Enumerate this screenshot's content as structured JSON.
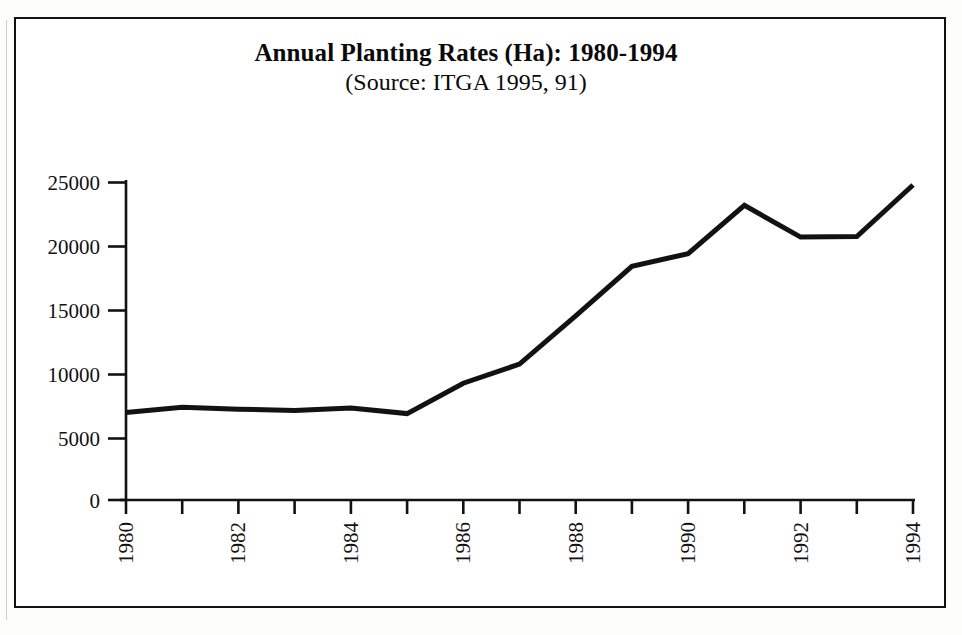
{
  "figure": {
    "title": "Annual Planting Rates (Ha): 1980-1994",
    "subtitle": "(Source: ITGA 1995, 91)"
  },
  "axes": {
    "y_tick_labels": [
      "25000",
      "20000",
      "15000",
      "10000",
      "5000",
      "0"
    ],
    "x_tick_labels_visible": [
      "1980",
      "1982",
      "1984",
      "1986",
      "1988",
      "1990",
      "1992",
      "1994"
    ]
  },
  "colors": {
    "line": "#121212",
    "axis": "#121212",
    "frame": "#121212",
    "background": "#ffffff",
    "text": "#0a0a0a"
  },
  "chart_data": {
    "type": "line",
    "title": "Annual Planting Rates (Ha): 1980-1994",
    "subtitle": "(Source: ITGA 1995, 91)",
    "xlabel": "",
    "ylabel": "",
    "x": [
      1980,
      1981,
      1982,
      1983,
      1984,
      1985,
      1986,
      1987,
      1988,
      1989,
      1990,
      1991,
      1992,
      1993,
      1994
    ],
    "values": [
      6900,
      7300,
      7150,
      7050,
      7250,
      6800,
      9200,
      10700,
      14500,
      18400,
      19400,
      23200,
      20700,
      20750,
      24800
    ],
    "series": [
      {
        "name": "Annual planting rate (Ha)",
        "values": [
          6900,
          7300,
          7150,
          7050,
          7250,
          6800,
          9200,
          10700,
          14500,
          18400,
          19400,
          23200,
          20700,
          20750,
          24800
        ]
      }
    ],
    "xlim": [
      1980,
      1994
    ],
    "ylim": [
      0,
      25000
    ],
    "yticks": [
      0,
      5000,
      10000,
      15000,
      20000,
      25000
    ],
    "xticks": [
      1980,
      1981,
      1982,
      1983,
      1984,
      1985,
      1986,
      1987,
      1988,
      1989,
      1990,
      1991,
      1992,
      1993,
      1994
    ],
    "xtick_labels_shown_every": 2,
    "xtick_label_rotation": 90,
    "grid": false,
    "legend": false,
    "units": "Hectares (Ha)"
  }
}
